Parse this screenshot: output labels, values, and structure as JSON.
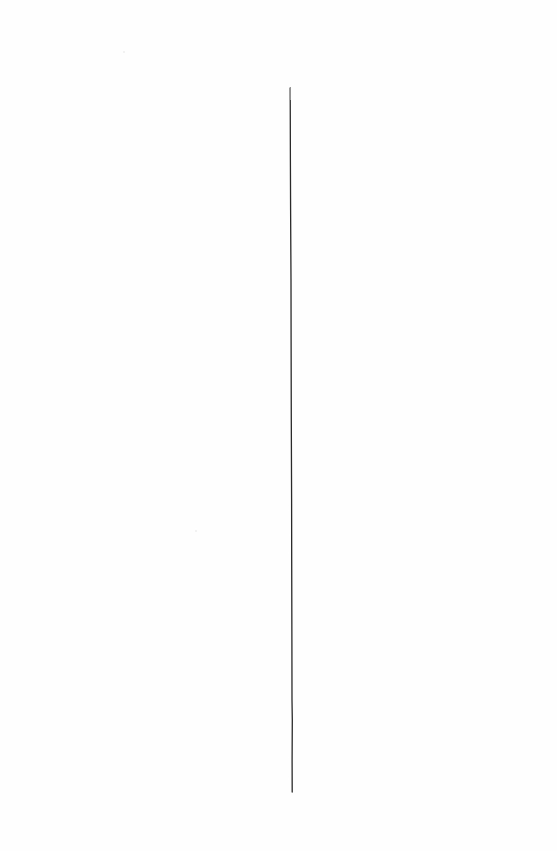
{
  "page": {
    "background": "#fefefe"
  },
  "rule": {
    "color": "#2a2a2a",
    "top": {
      "x": 290,
      "y": 88
    },
    "bottom": {
      "x": 292,
      "y": 792
    },
    "width_px": 1.3
  },
  "text_content": []
}
